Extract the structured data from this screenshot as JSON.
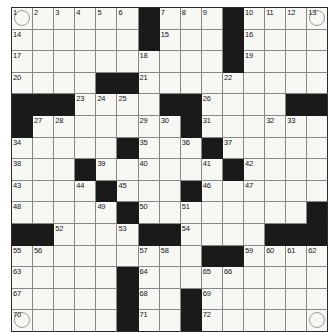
{
  "puzzle": {
    "type": "crossword-grid",
    "title": "Crossword Puzzle Grid",
    "rows": 15,
    "columns": 15,
    "cell_size_px": 21,
    "colors": {
      "block": "#1a1a1a",
      "cell": "#f7f7f4",
      "grid_line": "#888888",
      "border": "#2b2b2b",
      "number_text": "#15151a",
      "circle_outline": "#9a9a9a"
    },
    "legend": {
      "block_label": "blocked-square",
      "open_label": "open-square",
      "circled_label": "circled-square"
    },
    "numbers_sequence": [
      1,
      2,
      3,
      4,
      5,
      6,
      7,
      8,
      9,
      10,
      11,
      12,
      13,
      14,
      15,
      16,
      17,
      18,
      19,
      20,
      21,
      22,
      23,
      24,
      25,
      26,
      27,
      28,
      29,
      30,
      31,
      32,
      33,
      34,
      35,
      36,
      37,
      38,
      39,
      40,
      41,
      42,
      43,
      44,
      45,
      46,
      47,
      48,
      49,
      50,
      51,
      52,
      53,
      54,
      55,
      56,
      57,
      58,
      59,
      60,
      61,
      62,
      63,
      64,
      65,
      66,
      67,
      68,
      69,
      70,
      71,
      72
    ],
    "circled_cells": [
      {
        "row": 0,
        "col": 0,
        "number": "1"
      },
      {
        "row": 0,
        "col": 14,
        "number": "13"
      },
      {
        "row": 14,
        "col": 0,
        "number": "70"
      },
      {
        "row": 14,
        "col": 14,
        "number": ""
      }
    ],
    "grid": [
      [
        {
          "block": false,
          "num": "1",
          "circle": true
        },
        {
          "block": false,
          "num": "2"
        },
        {
          "block": false,
          "num": "3"
        },
        {
          "block": false,
          "num": "4"
        },
        {
          "block": false,
          "num": "5"
        },
        {
          "block": false,
          "num": "6"
        },
        {
          "block": true,
          "num": ""
        },
        {
          "block": false,
          "num": "7"
        },
        {
          "block": false,
          "num": "8"
        },
        {
          "block": false,
          "num": "9"
        },
        {
          "block": true,
          "num": ""
        },
        {
          "block": false,
          "num": "10"
        },
        {
          "block": false,
          "num": "11"
        },
        {
          "block": false,
          "num": "12"
        },
        {
          "block": false,
          "num": "13",
          "circle": true
        }
      ],
      [
        {
          "block": false,
          "num": "14"
        },
        {
          "block": false,
          "num": ""
        },
        {
          "block": false,
          "num": ""
        },
        {
          "block": false,
          "num": ""
        },
        {
          "block": false,
          "num": ""
        },
        {
          "block": false,
          "num": ""
        },
        {
          "block": true,
          "num": ""
        },
        {
          "block": false,
          "num": "15"
        },
        {
          "block": false,
          "num": ""
        },
        {
          "block": false,
          "num": ""
        },
        {
          "block": true,
          "num": ""
        },
        {
          "block": false,
          "num": "16"
        },
        {
          "block": false,
          "num": ""
        },
        {
          "block": false,
          "num": ""
        },
        {
          "block": false,
          "num": ""
        }
      ],
      [
        {
          "block": false,
          "num": "17"
        },
        {
          "block": false,
          "num": ""
        },
        {
          "block": false,
          "num": ""
        },
        {
          "block": false,
          "num": ""
        },
        {
          "block": false,
          "num": ""
        },
        {
          "block": false,
          "num": ""
        },
        {
          "block": false,
          "num": "18"
        },
        {
          "block": false,
          "num": ""
        },
        {
          "block": false,
          "num": ""
        },
        {
          "block": false,
          "num": ""
        },
        {
          "block": true,
          "num": ""
        },
        {
          "block": false,
          "num": "19"
        },
        {
          "block": false,
          "num": ""
        },
        {
          "block": false,
          "num": ""
        },
        {
          "block": false,
          "num": ""
        }
      ],
      [
        {
          "block": false,
          "num": "20"
        },
        {
          "block": false,
          "num": ""
        },
        {
          "block": false,
          "num": ""
        },
        {
          "block": false,
          "num": ""
        },
        {
          "block": true,
          "num": ""
        },
        {
          "block": true,
          "num": ""
        },
        {
          "block": false,
          "num": "21"
        },
        {
          "block": false,
          "num": ""
        },
        {
          "block": false,
          "num": ""
        },
        {
          "block": false,
          "num": ""
        },
        {
          "block": false,
          "num": "22"
        },
        {
          "block": false,
          "num": ""
        },
        {
          "block": false,
          "num": ""
        },
        {
          "block": false,
          "num": ""
        },
        {
          "block": false,
          "num": ""
        }
      ],
      [
        {
          "block": true,
          "num": ""
        },
        {
          "block": true,
          "num": ""
        },
        {
          "block": true,
          "num": ""
        },
        {
          "block": false,
          "num": "23"
        },
        {
          "block": false,
          "num": "24"
        },
        {
          "block": false,
          "num": "25"
        },
        {
          "block": false,
          "num": ""
        },
        {
          "block": true,
          "num": ""
        },
        {
          "block": true,
          "num": ""
        },
        {
          "block": false,
          "num": "26"
        },
        {
          "block": false,
          "num": ""
        },
        {
          "block": false,
          "num": ""
        },
        {
          "block": false,
          "num": ""
        },
        {
          "block": true,
          "num": ""
        },
        {
          "block": true,
          "num": ""
        }
      ],
      [
        {
          "block": true,
          "num": ""
        },
        {
          "block": false,
          "num": "27"
        },
        {
          "block": false,
          "num": "28"
        },
        {
          "block": false,
          "num": ""
        },
        {
          "block": false,
          "num": ""
        },
        {
          "block": false,
          "num": ""
        },
        {
          "block": false,
          "num": "29"
        },
        {
          "block": false,
          "num": "30"
        },
        {
          "block": true,
          "num": ""
        },
        {
          "block": false,
          "num": "31"
        },
        {
          "block": false,
          "num": ""
        },
        {
          "block": false,
          "num": ""
        },
        {
          "block": false,
          "num": "32"
        },
        {
          "block": false,
          "num": "33"
        },
        {
          "block": false,
          "num": ""
        }
      ],
      [
        {
          "block": false,
          "num": "34"
        },
        {
          "block": false,
          "num": ""
        },
        {
          "block": false,
          "num": ""
        },
        {
          "block": false,
          "num": ""
        },
        {
          "block": false,
          "num": ""
        },
        {
          "block": true,
          "num": ""
        },
        {
          "block": false,
          "num": "35"
        },
        {
          "block": false,
          "num": ""
        },
        {
          "block": false,
          "num": "36"
        },
        {
          "block": true,
          "num": ""
        },
        {
          "block": false,
          "num": "37"
        },
        {
          "block": false,
          "num": ""
        },
        {
          "block": false,
          "num": ""
        },
        {
          "block": false,
          "num": ""
        },
        {
          "block": false,
          "num": ""
        }
      ],
      [
        {
          "block": false,
          "num": "38"
        },
        {
          "block": false,
          "num": ""
        },
        {
          "block": false,
          "num": ""
        },
        {
          "block": true,
          "num": ""
        },
        {
          "block": false,
          "num": "39"
        },
        {
          "block": false,
          "num": ""
        },
        {
          "block": false,
          "num": "40"
        },
        {
          "block": false,
          "num": ""
        },
        {
          "block": false,
          "num": ""
        },
        {
          "block": false,
          "num": "41"
        },
        {
          "block": true,
          "num": ""
        },
        {
          "block": false,
          "num": "42"
        },
        {
          "block": false,
          "num": ""
        },
        {
          "block": false,
          "num": ""
        },
        {
          "block": false,
          "num": ""
        }
      ],
      [
        {
          "block": false,
          "num": "43"
        },
        {
          "block": false,
          "num": ""
        },
        {
          "block": false,
          "num": ""
        },
        {
          "block": false,
          "num": "44"
        },
        {
          "block": true,
          "num": ""
        },
        {
          "block": false,
          "num": "45"
        },
        {
          "block": false,
          "num": ""
        },
        {
          "block": false,
          "num": ""
        },
        {
          "block": true,
          "num": ""
        },
        {
          "block": false,
          "num": "46"
        },
        {
          "block": false,
          "num": ""
        },
        {
          "block": false,
          "num": "47"
        },
        {
          "block": false,
          "num": ""
        },
        {
          "block": false,
          "num": ""
        },
        {
          "block": false,
          "num": ""
        }
      ],
      [
        {
          "block": false,
          "num": "48"
        },
        {
          "block": false,
          "num": ""
        },
        {
          "block": false,
          "num": ""
        },
        {
          "block": false,
          "num": ""
        },
        {
          "block": false,
          "num": "49"
        },
        {
          "block": true,
          "num": ""
        },
        {
          "block": false,
          "num": "50"
        },
        {
          "block": false,
          "num": ""
        },
        {
          "block": false,
          "num": "51"
        },
        {
          "block": false,
          "num": ""
        },
        {
          "block": false,
          "num": ""
        },
        {
          "block": false,
          "num": ""
        },
        {
          "block": false,
          "num": ""
        },
        {
          "block": false,
          "num": ""
        },
        {
          "block": true,
          "num": ""
        }
      ],
      [
        {
          "block": true,
          "num": ""
        },
        {
          "block": true,
          "num": ""
        },
        {
          "block": false,
          "num": "52"
        },
        {
          "block": false,
          "num": ""
        },
        {
          "block": false,
          "num": ""
        },
        {
          "block": false,
          "num": "53"
        },
        {
          "block": true,
          "num": ""
        },
        {
          "block": true,
          "num": ""
        },
        {
          "block": false,
          "num": "54"
        },
        {
          "block": false,
          "num": ""
        },
        {
          "block": false,
          "num": ""
        },
        {
          "block": false,
          "num": ""
        },
        {
          "block": true,
          "num": ""
        },
        {
          "block": true,
          "num": ""
        },
        {
          "block": true,
          "num": ""
        }
      ],
      [
        {
          "block": false,
          "num": "55"
        },
        {
          "block": false,
          "num": "56"
        },
        {
          "block": false,
          "num": ""
        },
        {
          "block": false,
          "num": ""
        },
        {
          "block": false,
          "num": ""
        },
        {
          "block": false,
          "num": ""
        },
        {
          "block": false,
          "num": "57"
        },
        {
          "block": false,
          "num": "58"
        },
        {
          "block": false,
          "num": ""
        },
        {
          "block": true,
          "num": ""
        },
        {
          "block": true,
          "num": ""
        },
        {
          "block": false,
          "num": "59"
        },
        {
          "block": false,
          "num": "60"
        },
        {
          "block": false,
          "num": "61"
        },
        {
          "block": false,
          "num": "62"
        }
      ],
      [
        {
          "block": false,
          "num": "63"
        },
        {
          "block": false,
          "num": ""
        },
        {
          "block": false,
          "num": ""
        },
        {
          "block": false,
          "num": ""
        },
        {
          "block": false,
          "num": ""
        },
        {
          "block": true,
          "num": ""
        },
        {
          "block": false,
          "num": "64"
        },
        {
          "block": false,
          "num": ""
        },
        {
          "block": false,
          "num": ""
        },
        {
          "block": false,
          "num": "65"
        },
        {
          "block": false,
          "num": "66"
        },
        {
          "block": false,
          "num": ""
        },
        {
          "block": false,
          "num": ""
        },
        {
          "block": false,
          "num": ""
        },
        {
          "block": false,
          "num": ""
        }
      ],
      [
        {
          "block": false,
          "num": "67"
        },
        {
          "block": false,
          "num": ""
        },
        {
          "block": false,
          "num": ""
        },
        {
          "block": false,
          "num": ""
        },
        {
          "block": false,
          "num": ""
        },
        {
          "block": true,
          "num": ""
        },
        {
          "block": false,
          "num": "68"
        },
        {
          "block": false,
          "num": ""
        },
        {
          "block": true,
          "num": ""
        },
        {
          "block": false,
          "num": "69"
        },
        {
          "block": false,
          "num": ""
        },
        {
          "block": false,
          "num": ""
        },
        {
          "block": false,
          "num": ""
        },
        {
          "block": false,
          "num": ""
        },
        {
          "block": false,
          "num": ""
        }
      ],
      [
        {
          "block": false,
          "num": "70",
          "circle": true
        },
        {
          "block": false,
          "num": ""
        },
        {
          "block": false,
          "num": ""
        },
        {
          "block": false,
          "num": ""
        },
        {
          "block": false,
          "num": ""
        },
        {
          "block": true,
          "num": ""
        },
        {
          "block": false,
          "num": "71"
        },
        {
          "block": false,
          "num": ""
        },
        {
          "block": true,
          "num": ""
        },
        {
          "block": false,
          "num": "72"
        },
        {
          "block": false,
          "num": ""
        },
        {
          "block": false,
          "num": ""
        },
        {
          "block": false,
          "num": ""
        },
        {
          "block": false,
          "num": ""
        },
        {
          "block": false,
          "num": "",
          "circle": true
        }
      ]
    ]
  }
}
